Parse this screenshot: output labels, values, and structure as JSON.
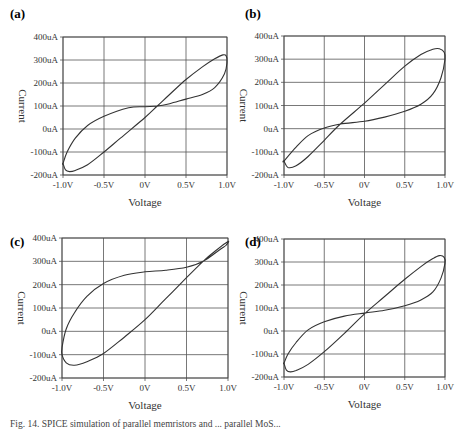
{
  "caption": "Fig. 14. SPICE simulation of parallel memristors and ... parallel MoS...",
  "chart_data": [
    {
      "id": "a",
      "panel_label": "(a)",
      "type": "line",
      "xlabel": "Voltage",
      "ylabel": "Current",
      "xlim": [
        -1.0,
        1.0
      ],
      "ylim": [
        -200,
        400
      ],
      "x_ticks": [
        -1.0,
        -0.5,
        0,
        0.5,
        1.0
      ],
      "x_tick_labels": [
        "-1.0V",
        "-0.5V",
        "0V",
        "0.5V",
        "1.0V"
      ],
      "y_ticks": [
        400,
        300,
        200,
        100,
        0,
        -100,
        -200
      ],
      "y_tick_labels": [
        "400uA",
        "300uA",
        "200uA",
        "100uA",
        "0uA",
        "-100uA",
        "-200uA"
      ],
      "grid": true,
      "series": [
        {
          "name": "I-V loop",
          "x": [
            -1.0,
            -0.97,
            -0.92,
            -0.85,
            -0.7,
            -0.5,
            -0.3,
            0,
            0.15,
            0.3,
            0.5,
            0.7,
            0.85,
            0.95,
            0.99,
            1.0,
            0.97,
            0.85,
            0.7,
            0.5,
            0.3,
            0.15,
            0,
            -0.2,
            -0.5,
            -0.7,
            -0.85,
            -0.95,
            -1.0
          ],
          "y": [
            -150,
            -178,
            -185,
            -180,
            -155,
            -100,
            -40,
            50,
            100,
            150,
            215,
            270,
            305,
            322,
            318,
            290,
            240,
            180,
            150,
            130,
            110,
            100,
            97,
            92,
            55,
            15,
            -40,
            -100,
            -150
          ]
        }
      ]
    },
    {
      "id": "b",
      "panel_label": "(b)",
      "type": "line",
      "xlabel": "Voltage",
      "ylabel": "Current",
      "xlim": [
        -1.0,
        1.0
      ],
      "ylim": [
        -200,
        400
      ],
      "x_ticks": [
        -1.0,
        -0.5,
        0,
        0.5,
        1.0
      ],
      "x_tick_labels": [
        "-1.0V",
        "-0.5V",
        "0V",
        "0.5V",
        "1.0V"
      ],
      "y_ticks": [
        400,
        300,
        200,
        100,
        0,
        -100,
        -200
      ],
      "y_tick_labels": [
        "400uA",
        "300uA",
        "200uA",
        "100uA",
        "0uA",
        "-100uA",
        "-200uA"
      ],
      "grid": true,
      "series": [
        {
          "name": "I-V loop",
          "x": [
            -1.0,
            -0.95,
            -0.85,
            -0.7,
            -0.5,
            -0.3,
            0,
            0.25,
            0.5,
            0.7,
            0.85,
            0.93,
            0.99,
            1.0,
            0.95,
            0.85,
            0.7,
            0.5,
            0.25,
            0,
            -0.3,
            -0.5,
            -0.7,
            -0.85,
            -1.0
          ],
          "y": [
            -140,
            -167,
            -160,
            -120,
            -50,
            20,
            110,
            190,
            270,
            320,
            343,
            345,
            330,
            300,
            220,
            150,
            105,
            75,
            50,
            32,
            20,
            3,
            -30,
            -80,
            -140
          ]
        }
      ]
    },
    {
      "id": "c",
      "panel_label": "(c)",
      "type": "line",
      "xlabel": "Voltage",
      "ylabel": "Current",
      "xlim": [
        -1.0,
        1.0
      ],
      "ylim": [
        -200,
        400
      ],
      "x_ticks": [
        -1.0,
        -0.5,
        0,
        0.5,
        1.0
      ],
      "x_tick_labels": [
        "-1.0V",
        "-0.5V",
        "0V",
        "0.5V",
        "1.0V"
      ],
      "y_ticks": [
        400,
        300,
        200,
        100,
        0,
        -100,
        -200
      ],
      "y_tick_labels": [
        "400uA",
        "300uA",
        "200uA",
        "100uA",
        "0uA",
        "-100uA",
        "-200uA"
      ],
      "grid": true,
      "series": [
        {
          "name": "I-V loop",
          "x": [
            -1.0,
            -0.95,
            -0.85,
            -0.7,
            -0.5,
            -0.25,
            0,
            0.25,
            0.5,
            0.7,
            0.85,
            1.0,
            0.98,
            0.9,
            0.7,
            0.5,
            0.25,
            0,
            -0.25,
            -0.5,
            -0.7,
            -0.85,
            -0.95,
            -1.0
          ],
          "y": [
            -100,
            -135,
            -145,
            -130,
            -95,
            -25,
            50,
            140,
            230,
            300,
            345,
            385,
            370,
            350,
            300,
            275,
            262,
            255,
            240,
            205,
            150,
            80,
            10,
            -70
          ]
        }
      ]
    },
    {
      "id": "d",
      "panel_label": "(d)",
      "type": "line",
      "xlabel": "Voltage",
      "ylabel": "Current",
      "xlim": [
        -1.0,
        1.0
      ],
      "ylim": [
        -200,
        400
      ],
      "x_ticks": [
        -1.0,
        -0.5,
        0,
        0.5,
        1.0
      ],
      "x_tick_labels": [
        "-1.0V",
        "-0.5V",
        "0V",
        "0.5V",
        "1.0V"
      ],
      "y_ticks": [
        400,
        300,
        200,
        100,
        0,
        -100,
        -200
      ],
      "y_tick_labels": [
        "400uA",
        "300uA",
        "200uA",
        "100uA",
        "0uA",
        "-100uA",
        "-200uA"
      ],
      "grid": true,
      "series": [
        {
          "name": "I-V loop",
          "x": [
            -1.0,
            -0.97,
            -0.92,
            -0.85,
            -0.7,
            -0.5,
            -0.25,
            0,
            0.25,
            0.5,
            0.7,
            0.85,
            0.93,
            0.99,
            1.0,
            0.95,
            0.85,
            0.7,
            0.5,
            0.25,
            0,
            -0.25,
            -0.5,
            -0.7,
            -0.85,
            -0.95,
            -1.0
          ],
          "y": [
            -140,
            -170,
            -178,
            -172,
            -145,
            -90,
            -10,
            75,
            150,
            225,
            280,
            315,
            328,
            320,
            295,
            230,
            170,
            135,
            110,
            90,
            78,
            65,
            40,
            5,
            -50,
            -100,
            -140
          ]
        }
      ]
    }
  ]
}
